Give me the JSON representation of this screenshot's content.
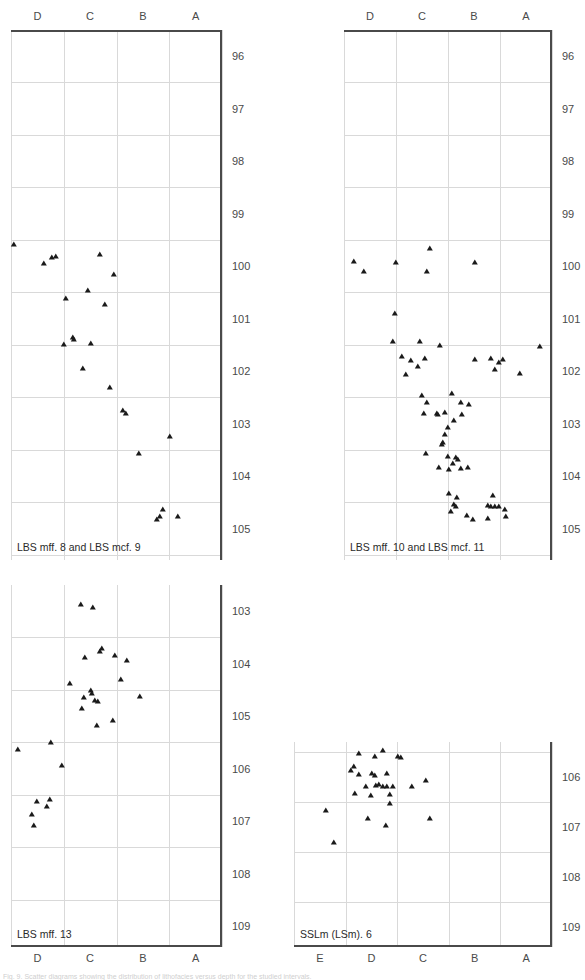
{
  "figure": {
    "width": 585,
    "height": 980,
    "background": "#ffffff",
    "marker_color": "#1a1a1a",
    "grid_color": "#d9d9d9",
    "axis_color": "#4a4a4a",
    "footer_note": "Fig. 9. Scatter diagrams showing the distribution of lithofacies versus depth for the studied intervals."
  },
  "chart_data": [
    {
      "type": "scatter",
      "id": "panel-1",
      "title": "LBS mff. 8 and LBS mcf. 9",
      "xlabel": "",
      "ylabel": "",
      "x_axis_position": "top",
      "y_axis_position": "right",
      "y_inverted": true,
      "grid": true,
      "categories": [
        "D",
        "C",
        "B",
        "A"
      ],
      "category_positions": [
        1,
        2,
        3,
        4
      ],
      "xlim": [
        0.5,
        4.5
      ],
      "ylim": [
        95.5,
        105.6
      ],
      "yticks": [
        96,
        97,
        98,
        99,
        100,
        101,
        102,
        103,
        104,
        105
      ],
      "points": [
        {
          "x": 0.55,
          "y": 99.63
        },
        {
          "x": 1.28,
          "y": 99.88
        },
        {
          "x": 1.35,
          "y": 99.86
        },
        {
          "x": 1.12,
          "y": 99.99
        },
        {
          "x": 2.18,
          "y": 99.83
        },
        {
          "x": 2.46,
          "y": 100.21
        },
        {
          "x": 1.95,
          "y": 100.52
        },
        {
          "x": 1.55,
          "y": 100.66
        },
        {
          "x": 2.28,
          "y": 100.77
        },
        {
          "x": 1.68,
          "y": 101.4
        },
        {
          "x": 1.7,
          "y": 101.44
        },
        {
          "x": 1.5,
          "y": 101.54
        },
        {
          "x": 2.02,
          "y": 101.52
        },
        {
          "x": 1.86,
          "y": 102.0
        },
        {
          "x": 2.38,
          "y": 102.36
        },
        {
          "x": 2.62,
          "y": 102.8
        },
        {
          "x": 2.68,
          "y": 102.86
        },
        {
          "x": 3.52,
          "y": 103.3
        },
        {
          "x": 2.92,
          "y": 103.62
        },
        {
          "x": 3.38,
          "y": 104.69
        },
        {
          "x": 3.32,
          "y": 104.81
        },
        {
          "x": 3.26,
          "y": 104.88
        },
        {
          "x": 3.66,
          "y": 104.81
        }
      ]
    },
    {
      "type": "scatter",
      "id": "panel-2",
      "title": "LBS mff. 10 and LBS mcf. 11",
      "xlabel": "",
      "ylabel": "",
      "x_axis_position": "top",
      "y_axis_position": "right",
      "y_inverted": true,
      "grid": true,
      "categories": [
        "D",
        "C",
        "B",
        "A"
      ],
      "category_positions": [
        1,
        2,
        3,
        4
      ],
      "xlim": [
        0.5,
        4.5
      ],
      "ylim": [
        95.5,
        105.6
      ],
      "yticks": [
        96,
        97,
        98,
        99,
        100,
        101,
        102,
        103,
        104,
        105
      ],
      "points": [
        {
          "x": 0.7,
          "y": 99.96
        },
        {
          "x": 1.5,
          "y": 99.98
        },
        {
          "x": 2.16,
          "y": 99.72
        },
        {
          "x": 3.02,
          "y": 99.98
        },
        {
          "x": 0.88,
          "y": 100.15
        },
        {
          "x": 2.1,
          "y": 100.15
        },
        {
          "x": 1.48,
          "y": 100.95
        },
        {
          "x": 1.44,
          "y": 101.48
        },
        {
          "x": 1.96,
          "y": 101.48
        },
        {
          "x": 2.34,
          "y": 101.55
        },
        {
          "x": 1.62,
          "y": 101.76
        },
        {
          "x": 2.06,
          "y": 101.8
        },
        {
          "x": 3.56,
          "y": 101.82
        },
        {
          "x": 3.48,
          "y": 101.88
        },
        {
          "x": 4.26,
          "y": 101.58
        },
        {
          "x": 1.78,
          "y": 101.84
        },
        {
          "x": 3.02,
          "y": 101.83
        },
        {
          "x": 3.32,
          "y": 101.8
        },
        {
          "x": 1.92,
          "y": 101.96
        },
        {
          "x": 1.7,
          "y": 102.12
        },
        {
          "x": 3.88,
          "y": 102.1
        },
        {
          "x": 3.4,
          "y": 102.02
        },
        {
          "x": 2.0,
          "y": 102.52
        },
        {
          "x": 2.58,
          "y": 102.48
        },
        {
          "x": 2.1,
          "y": 102.65
        },
        {
          "x": 2.74,
          "y": 102.64
        },
        {
          "x": 2.9,
          "y": 102.68
        },
        {
          "x": 2.04,
          "y": 102.86
        },
        {
          "x": 2.28,
          "y": 102.85
        },
        {
          "x": 2.3,
          "y": 102.88
        },
        {
          "x": 2.44,
          "y": 102.83
        },
        {
          "x": 2.76,
          "y": 102.88
        },
        {
          "x": 2.62,
          "y": 102.98
        },
        {
          "x": 2.5,
          "y": 103.12
        },
        {
          "x": 2.44,
          "y": 103.25
        },
        {
          "x": 2.4,
          "y": 103.4
        },
        {
          "x": 2.38,
          "y": 103.45
        },
        {
          "x": 2.08,
          "y": 103.62
        },
        {
          "x": 2.5,
          "y": 103.68
        },
        {
          "x": 2.66,
          "y": 103.7
        },
        {
          "x": 2.7,
          "y": 103.73
        },
        {
          "x": 2.6,
          "y": 103.8
        },
        {
          "x": 2.32,
          "y": 103.88
        },
        {
          "x": 2.52,
          "y": 103.92
        },
        {
          "x": 2.74,
          "y": 103.9
        },
        {
          "x": 2.88,
          "y": 103.88
        },
        {
          "x": 2.52,
          "y": 104.38
        },
        {
          "x": 2.68,
          "y": 104.45
        },
        {
          "x": 2.62,
          "y": 104.58
        },
        {
          "x": 2.66,
          "y": 104.62
        },
        {
          "x": 2.56,
          "y": 104.72
        },
        {
          "x": 3.36,
          "y": 104.42
        },
        {
          "x": 3.26,
          "y": 104.6
        },
        {
          "x": 3.32,
          "y": 104.62
        },
        {
          "x": 3.4,
          "y": 104.62
        },
        {
          "x": 3.48,
          "y": 104.62
        },
        {
          "x": 3.6,
          "y": 104.68
        },
        {
          "x": 3.26,
          "y": 104.85
        },
        {
          "x": 3.62,
          "y": 104.82
        },
        {
          "x": 2.86,
          "y": 104.8
        },
        {
          "x": 2.98,
          "y": 104.88
        }
      ]
    },
    {
      "type": "scatter",
      "id": "panel-3",
      "title": "LBS mff. 13",
      "xlabel": "",
      "ylabel": "",
      "x_axis_position": "bottom",
      "y_axis_position": "right",
      "y_inverted": true,
      "grid": true,
      "categories": [
        "D",
        "C",
        "B",
        "A"
      ],
      "category_positions": [
        1,
        2,
        3,
        4
      ],
      "xlim": [
        0.5,
        4.5
      ],
      "ylim": [
        102.5,
        109.4
      ],
      "yticks": [
        103,
        104,
        105,
        106,
        107,
        108,
        109
      ],
      "points": [
        {
          "x": 1.82,
          "y": 102.92
        },
        {
          "x": 2.06,
          "y": 102.98
        },
        {
          "x": 2.22,
          "y": 103.75
        },
        {
          "x": 2.18,
          "y": 103.82
        },
        {
          "x": 1.9,
          "y": 103.92
        },
        {
          "x": 2.48,
          "y": 103.9
        },
        {
          "x": 2.7,
          "y": 103.98
        },
        {
          "x": 2.58,
          "y": 104.35
        },
        {
          "x": 1.62,
          "y": 104.42
        },
        {
          "x": 2.02,
          "y": 104.55
        },
        {
          "x": 2.04,
          "y": 104.62
        },
        {
          "x": 1.88,
          "y": 104.7
        },
        {
          "x": 2.1,
          "y": 104.74
        },
        {
          "x": 2.14,
          "y": 104.76
        },
        {
          "x": 2.94,
          "y": 104.68
        },
        {
          "x": 1.84,
          "y": 104.9
        },
        {
          "x": 2.44,
          "y": 105.12
        },
        {
          "x": 2.12,
          "y": 105.22
        },
        {
          "x": 1.26,
          "y": 105.55
        },
        {
          "x": 0.64,
          "y": 105.68
        },
        {
          "x": 1.46,
          "y": 105.98
        },
        {
          "x": 1.0,
          "y": 106.67
        },
        {
          "x": 1.24,
          "y": 106.63
        },
        {
          "x": 1.18,
          "y": 106.76
        },
        {
          "x": 0.9,
          "y": 106.92
        },
        {
          "x": 0.94,
          "y": 107.14
        }
      ]
    },
    {
      "type": "scatter",
      "id": "panel-4",
      "title": "SSLm (LSm). 6",
      "xlabel": "",
      "ylabel": "",
      "x_axis_position": "bottom",
      "y_axis_position": "right",
      "y_inverted": true,
      "grid": true,
      "categories": [
        "E",
        "D",
        "C",
        "B",
        "A"
      ],
      "category_positions": [
        1,
        2,
        3,
        4,
        5
      ],
      "xlim": [
        0.5,
        5.5
      ],
      "ylim": [
        105.3,
        109.4
      ],
      "yticks": [
        106,
        107,
        108,
        109
      ],
      "points": [
        {
          "x": 1.76,
          "y": 105.58
        },
        {
          "x": 2.22,
          "y": 105.52
        },
        {
          "x": 2.06,
          "y": 105.64
        },
        {
          "x": 2.52,
          "y": 105.64
        },
        {
          "x": 2.58,
          "y": 105.66
        },
        {
          "x": 1.66,
          "y": 105.84
        },
        {
          "x": 1.6,
          "y": 105.92
        },
        {
          "x": 1.76,
          "y": 106.0
        },
        {
          "x": 2.02,
          "y": 105.98
        },
        {
          "x": 2.06,
          "y": 106.02
        },
        {
          "x": 2.3,
          "y": 105.98
        },
        {
          "x": 1.9,
          "y": 106.24
        },
        {
          "x": 2.08,
          "y": 106.22
        },
        {
          "x": 2.14,
          "y": 106.2
        },
        {
          "x": 2.22,
          "y": 106.24
        },
        {
          "x": 2.3,
          "y": 106.24
        },
        {
          "x": 2.42,
          "y": 106.24
        },
        {
          "x": 2.78,
          "y": 106.24
        },
        {
          "x": 3.06,
          "y": 106.12
        },
        {
          "x": 1.68,
          "y": 106.38
        },
        {
          "x": 2.0,
          "y": 106.42
        },
        {
          "x": 2.36,
          "y": 106.4
        },
        {
          "x": 2.36,
          "y": 106.58
        },
        {
          "x": 1.12,
          "y": 106.72
        },
        {
          "x": 1.94,
          "y": 106.88
        },
        {
          "x": 3.14,
          "y": 106.88
        },
        {
          "x": 2.28,
          "y": 107.02
        },
        {
          "x": 1.28,
          "y": 107.36
        }
      ]
    }
  ],
  "panels": [
    {
      "id": "panel-1",
      "caption": "LBS mff. 8 and LBS mcf. 9",
      "x_labels": [
        "D",
        "C",
        "B",
        "A"
      ],
      "y_labels": [
        "96",
        "97",
        "98",
        "99",
        "100",
        "101",
        "102",
        "103",
        "104",
        "105"
      ]
    },
    {
      "id": "panel-2",
      "caption": "LBS mff. 10 and LBS mcf. 11",
      "x_labels": [
        "D",
        "C",
        "B",
        "A"
      ],
      "y_labels": [
        "96",
        "97",
        "98",
        "99",
        "100",
        "101",
        "102",
        "103",
        "104",
        "105"
      ]
    },
    {
      "id": "panel-3",
      "caption": "LBS mff. 13",
      "x_labels": [
        "D",
        "C",
        "B",
        "A"
      ],
      "y_labels": [
        "103",
        "104",
        "105",
        "106",
        "107",
        "108",
        "109"
      ]
    },
    {
      "id": "panel-4",
      "caption": "SSLm (LSm). 6",
      "x_labels": [
        "E",
        "D",
        "C",
        "B",
        "A"
      ],
      "y_labels": [
        "106",
        "107",
        "108",
        "109"
      ]
    }
  ]
}
